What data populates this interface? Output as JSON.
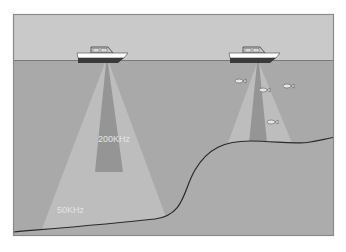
{
  "diagram": {
    "type": "sonar-frequency-beam-illustration",
    "colors": {
      "sky": "#c9c9c9",
      "water": "#a9a9a9",
      "seabed": "#acacac",
      "frame": "#8a8a8a",
      "wide_beam": "#bdbdbd",
      "narrow_beam": "#959595",
      "seabed_line": "#2a2a2a",
      "boat_hull": "#ffffff",
      "boat_keel": "#3a3a3a",
      "label_text": "#e4e4e4"
    },
    "labels": {
      "narrow_beam": "200KHz",
      "wide_beam": "50KHz"
    },
    "boats": [
      {
        "name": "left-boat",
        "transducer_x": 107,
        "transducer_y": 63
      },
      {
        "name": "right-boat",
        "transducer_x": 258,
        "transducer_y": 63
      }
    ],
    "fish": [
      {
        "x": 238,
        "y": 81
      },
      {
        "x": 262,
        "y": 90
      },
      {
        "x": 286,
        "y": 86
      },
      {
        "x": 270,
        "y": 122
      }
    ]
  }
}
